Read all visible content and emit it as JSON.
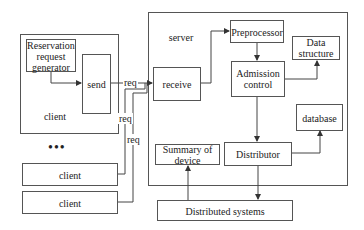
{
  "diagram": {
    "client_main": {
      "label": "client",
      "generator": {
        "label": "Reservation request generator"
      },
      "send": {
        "label": "send"
      }
    },
    "ellipsis": "•••",
    "other_clients": [
      {
        "label": "client"
      },
      {
        "label": "client"
      }
    ],
    "req_labels": [
      "req",
      "req",
      "req"
    ],
    "server": {
      "label": "server",
      "receive": {
        "label": "receive"
      },
      "preprocessor": {
        "label": "Preprocessor"
      },
      "data_structure": {
        "label": "Data structure"
      },
      "admission_control": {
        "label": "Admission control"
      },
      "database": {
        "label": "database"
      },
      "summary_of_device": {
        "label": "Summary of device"
      },
      "distributor": {
        "label": "Distributor"
      }
    },
    "distributed_systems": {
      "label": "Distributed systems"
    },
    "edges": [
      {
        "from": "Reservation request generator",
        "to": "send"
      },
      {
        "from": "send",
        "to": "receive",
        "label": "req"
      },
      {
        "from": "client",
        "to": "receive",
        "label": "req"
      },
      {
        "from": "client",
        "to": "receive",
        "label": "req"
      },
      {
        "from": "receive",
        "to": "Preprocessor"
      },
      {
        "from": "Preprocessor",
        "to": "Admission control"
      },
      {
        "from": "Admission control",
        "to": "Data structure"
      },
      {
        "from": "Admission control",
        "to": "Distributor"
      },
      {
        "from": "Distributor",
        "to": "database"
      },
      {
        "from": "Distributor",
        "to": "Distributed systems"
      },
      {
        "from": "Distributed systems",
        "to": "Summary of device"
      }
    ]
  }
}
